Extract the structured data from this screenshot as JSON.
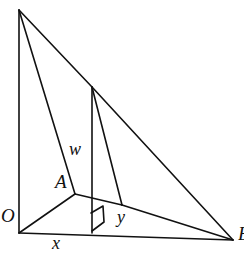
{
  "figure": {
    "kind": "geometry-diagram",
    "stroke_color": "#111111",
    "background_color": "#ffffff",
    "stroke_width": 1.6,
    "points": {
      "apex": {
        "name": "P",
        "x": 19,
        "y": 10
      },
      "origin": {
        "name": "O",
        "x": 19,
        "y": 233
      },
      "base_right": {
        "name": "B",
        "x": 233,
        "y": 240
      },
      "top_mid": {
        "name": "C",
        "x": 92,
        "y": 87
      },
      "foot_mid": {
        "name": "D",
        "x": 92,
        "y": 233
      },
      "inner_a": {
        "name": "A",
        "x": 75,
        "y": 194
      },
      "inner_e": {
        "name": "E",
        "x": 122,
        "y": 205
      }
    },
    "edges": [
      {
        "name": "apex-to-origin",
        "from": "apex",
        "to": "origin"
      },
      {
        "name": "origin-to-base-right",
        "from": "origin",
        "to": "base_right"
      },
      {
        "name": "apex-to-inner-a",
        "from": "apex",
        "to": "inner_a"
      },
      {
        "name": "apex-to-top-mid",
        "from": "apex",
        "to": "top_mid"
      },
      {
        "name": "top-mid-to-base-right",
        "from": "top_mid",
        "to": "base_right"
      },
      {
        "name": "top-mid-to-foot-mid",
        "from": "top_mid",
        "to": "foot_mid"
      },
      {
        "name": "top-mid-to-inner-e",
        "from": "top_mid",
        "to": "inner_e"
      },
      {
        "name": "inner-a-to-inner-e",
        "from": "inner_a",
        "to": "inner_e"
      },
      {
        "name": "inner-a-to-origin",
        "from": "inner_a",
        "to": "origin"
      },
      {
        "name": "inner-e-to-base-right",
        "from": "inner_e",
        "to": "base_right"
      }
    ],
    "right_angle_marker": {
      "name": "right-angle-at-foot-mid",
      "at": "foot_mid",
      "path": "M 91 213 L 103 206 L 104 222 L 92 231"
    },
    "labels": {
      "origin": "O",
      "vertex_a": "A",
      "height_w": "w",
      "base_x": "x",
      "depth_y": "y",
      "base_right": "B"
    }
  }
}
